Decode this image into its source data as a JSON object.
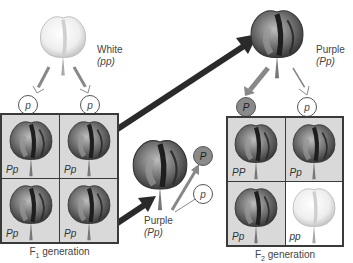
{
  "parents": {
    "white": {
      "phenotype": "White",
      "genotype": "(pp)"
    },
    "purple_top": {
      "phenotype": "Purple",
      "genotype": "(Pp)"
    },
    "purple_middle": {
      "phenotype": "Purple",
      "genotype": "(Pp)"
    }
  },
  "gametes": {
    "white_parent": [
      "p",
      "p"
    ],
    "purple_top": [
      "P",
      "p"
    ],
    "purple_middle": [
      "P",
      "p"
    ]
  },
  "f1": {
    "caption_main": "F",
    "caption_sub": "1",
    "caption_rest": " generation",
    "cells": [
      {
        "genotype": "Pp",
        "color": "purple"
      },
      {
        "genotype": "Pp",
        "color": "purple"
      },
      {
        "genotype": "Pp",
        "color": "purple"
      },
      {
        "genotype": "Pp",
        "color": "purple"
      }
    ]
  },
  "f2": {
    "caption_main": "F",
    "caption_sub": "2",
    "caption_rest": " generation",
    "cells": [
      {
        "genotype": "PP",
        "color": "purple"
      },
      {
        "genotype": "Pp",
        "color": "purple"
      },
      {
        "genotype": "Pp",
        "color": "purple"
      },
      {
        "genotype": "pp",
        "color": "white"
      }
    ]
  },
  "colors": {
    "grid_border": "#3a3a3a",
    "cell_bg": "#d9d9d9",
    "dominant_gamete": "#8a8a8a",
    "arrow": "#2a2a2a"
  }
}
